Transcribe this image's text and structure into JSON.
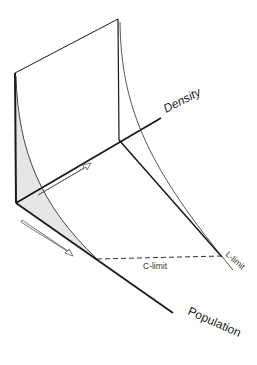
{
  "diagram": {
    "type": "3d-axes-schematic",
    "labels": {
      "density_axis": "Density",
      "population_axis": "Population",
      "c_limit": "C-limit",
      "l_limit": "L-limit"
    },
    "colors": {
      "line": "#1a1a1a",
      "thin_line": "#444444",
      "shade": "#e6e6e6",
      "background": "#ffffff"
    },
    "arrows": [
      {
        "name": "density-direction-arrow",
        "direction": "along density axis"
      },
      {
        "name": "population-direction-arrow",
        "direction": "along population axis"
      }
    ]
  }
}
